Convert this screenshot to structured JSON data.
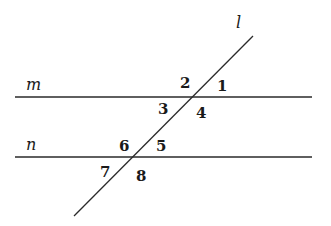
{
  "diagram": {
    "lines": {
      "m": {
        "label": "m",
        "x1": 15,
        "y1": 97,
        "x2": 312,
        "y2": 97
      },
      "n": {
        "label": "n",
        "x1": 15,
        "y1": 157,
        "x2": 312,
        "y2": 157
      },
      "l": {
        "label": "l",
        "x1": 253,
        "y1": 36,
        "x2": 74,
        "y2": 216
      }
    },
    "line_labels": {
      "m": {
        "text": "m",
        "x": 26,
        "y": 90
      },
      "n": {
        "text": "n",
        "x": 26,
        "y": 150
      },
      "l": {
        "text": "l",
        "x": 236,
        "y": 28
      }
    },
    "angles": [
      {
        "id": "1",
        "text": "1",
        "x": 217,
        "y": 91
      },
      {
        "id": "2",
        "text": "2",
        "x": 180,
        "y": 88
      },
      {
        "id": "3",
        "text": "3",
        "x": 158,
        "y": 114
      },
      {
        "id": "4",
        "text": "4",
        "x": 196,
        "y": 118
      },
      {
        "id": "5",
        "text": "5",
        "x": 156,
        "y": 151
      },
      {
        "id": "6",
        "text": "6",
        "x": 119,
        "y": 151
      },
      {
        "id": "7",
        "text": "7",
        "x": 100,
        "y": 177
      },
      {
        "id": "8",
        "text": "8",
        "x": 136,
        "y": 181
      }
    ],
    "colors": {
      "stroke": "#2a2a2a",
      "text": "#1a1a1a",
      "background": "#ffffff"
    }
  }
}
